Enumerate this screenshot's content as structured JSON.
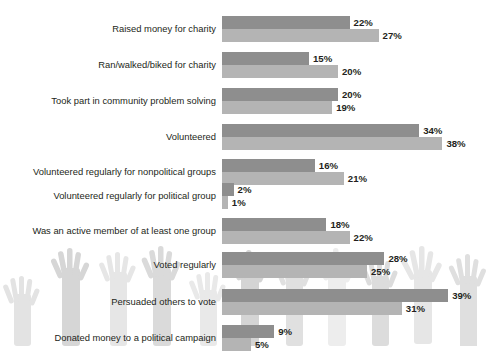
{
  "chart_data": {
    "type": "bar",
    "orientation": "horizontal",
    "title": "",
    "subtitle": "",
    "xlabel": "",
    "ylabel": "",
    "xlim": [
      0,
      39
    ],
    "grid": false,
    "legend_position": "inline-first-bar",
    "categories": [
      "Raised money for charity",
      "Ran/walked/biked for charity",
      "Took part in community problem solving",
      "Volunteered",
      "Volunteered regularly for nonpolitical groups",
      "Volunteered regularly for political group",
      "Was an active member of at least one group",
      "Voted regularly",
      "Persuaded others to vote",
      "Donated money to a political campaign"
    ],
    "series": [
      {
        "name": "Men",
        "color": "#8e8e8e",
        "values": [
          22,
          15,
          20,
          34,
          16,
          2,
          18,
          28,
          39,
          9
        ],
        "labels": [
          "22%",
          "15%",
          "20%",
          "34%",
          "16%",
          "2%",
          "18%",
          "28%",
          "39%",
          "9%"
        ]
      },
      {
        "name": "Women",
        "color": "#b4b4b4",
        "values": [
          27,
          20,
          19,
          38,
          21,
          1,
          22,
          25,
          31,
          5
        ],
        "labels": [
          "27%",
          "20%",
          "19%",
          "38%",
          "21%",
          "1%",
          "22%",
          "25%",
          "31%",
          "5%"
        ]
      }
    ],
    "background_graphic": "raised-hands-silhouettes"
  },
  "legend": {
    "men_label": "Men",
    "women_label": "Women"
  }
}
